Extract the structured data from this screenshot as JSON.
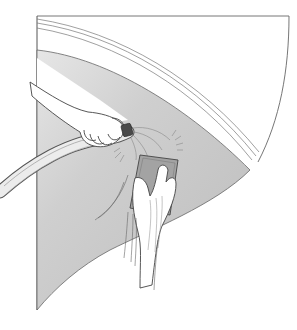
{
  "illustration": {
    "description": "Line drawing of a hand holding a garden hose nozzle spraying water while another hand scrubs a curved grey panel with a sponge",
    "subjects": [
      "hose-hand",
      "garden-hose",
      "hose-nozzle",
      "water-spray",
      "sponge",
      "scrubbing-hand",
      "curved-panel",
      "trim-stripes"
    ],
    "colors": {
      "background": "#ffffff",
      "panel_fill": "#c9c9c9",
      "panel_fill_light": "#e4e4e4",
      "line": "#555555",
      "skin": "#ffffff",
      "nozzle": "#4a4a4a",
      "sponge": "#9a9a9a"
    }
  }
}
